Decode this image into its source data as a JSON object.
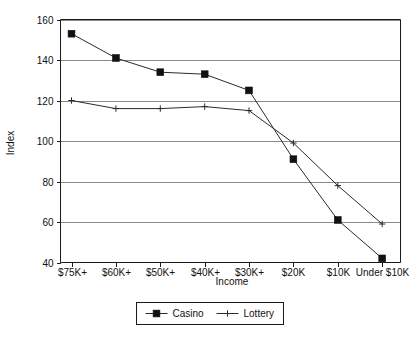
{
  "chart_data": {
    "type": "line",
    "title": "",
    "xlabel": "Income",
    "ylabel": "Index",
    "categories": [
      "$75K+",
      "$60K+",
      "$50K+",
      "$40K+",
      "$30K+",
      "$20K",
      "$10K",
      "Under $10K"
    ],
    "series": [
      {
        "name": "Casino",
        "marker": "filled-square",
        "values": [
          153,
          141,
          134,
          133,
          125,
          91,
          61,
          42
        ]
      },
      {
        "name": "Lottery",
        "marker": "plus",
        "values": [
          120,
          116,
          116,
          117,
          115,
          99,
          78,
          59
        ]
      }
    ],
    "ylim": [
      40,
      160
    ],
    "yticks": [
      40,
      60,
      80,
      100,
      120,
      140,
      160
    ],
    "grid": true,
    "grid_axis": "y",
    "legend_position": "bottom-center",
    "legend_entries": [
      "Casino",
      "Lottery"
    ],
    "colors": {
      "casino": "#111111",
      "lottery": "#2b2b2b",
      "grid": "#8a8a8a",
      "axis": "#1a1a1a",
      "background": "#ffffff"
    }
  }
}
